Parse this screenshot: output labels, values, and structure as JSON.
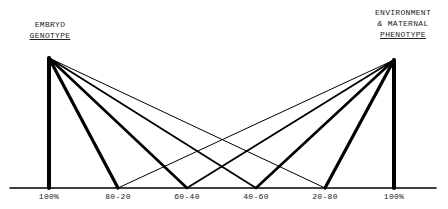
{
  "left_header": {
    "line1": "EMBRYO",
    "line2": "GENOTYPE"
  },
  "right_header": {
    "line1": "ENVIRONMENT",
    "line2": "& MATERNAL",
    "line3": "PHENOTYPE"
  },
  "baseline_labels": [
    "100%",
    "80-20",
    "60-40",
    "40-60",
    "20-80",
    "100%"
  ],
  "colors": {
    "ink": "#000000",
    "text": "#222222",
    "background": "#ffffff"
  },
  "geometry": {
    "baseline_y": 188,
    "baseline_x": [
      10,
      436
    ],
    "left_apex": [
      49,
      58
    ],
    "right_apex": [
      394,
      60
    ],
    "points_x": [
      49,
      118,
      187,
      256,
      325,
      394
    ],
    "left_widths": [
      4,
      3.2,
      2.6,
      1.8,
      1.0
    ],
    "right_widths": [
      1.0,
      1.8,
      2.6,
      3.2,
      4
    ]
  }
}
